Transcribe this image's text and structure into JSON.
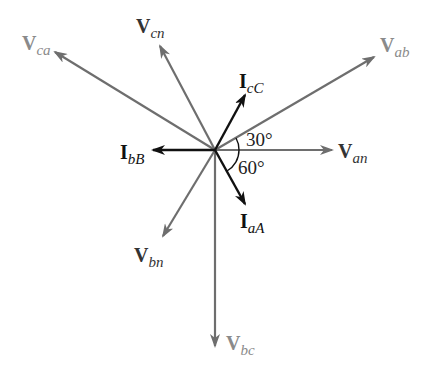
{
  "diagram": {
    "type": "phasor-diagram",
    "origin": [
      215,
      150
    ],
    "colors": {
      "voltage": "#6e6e6e",
      "voltage_label_line": "#9a9a9a",
      "current": "#111111",
      "angle_arc": "#111111"
    },
    "phasors": [
      {
        "id": "Van",
        "main": "V",
        "sub": "an",
        "kind": "voltage",
        "tip": [
          332,
          150
        ],
        "label_pos": [
          338,
          158
        ]
      },
      {
        "id": "Vab",
        "main": "V",
        "sub": "ab",
        "kind": "line-voltage",
        "tip": [
          374,
          57
        ],
        "label_pos": [
          380,
          52
        ]
      },
      {
        "id": "Vca",
        "main": "V",
        "sub": "ca",
        "kind": "line-voltage",
        "tip": [
          55,
          52
        ],
        "label_pos": [
          22,
          50
        ]
      },
      {
        "id": "Vcn",
        "main": "V",
        "sub": "cn",
        "kind": "voltage",
        "tip": [
          160,
          46
        ],
        "label_pos": [
          136,
          33
        ]
      },
      {
        "id": "Vbn",
        "main": "V",
        "sub": "bn",
        "kind": "voltage",
        "tip": [
          163,
          236
        ],
        "label_pos": [
          134,
          262
        ]
      },
      {
        "id": "Vbc",
        "main": "V",
        "sub": "bc",
        "kind": "line-voltage",
        "tip": [
          215,
          346
        ],
        "label_pos": [
          226,
          350
        ]
      },
      {
        "id": "IcC",
        "main": "I",
        "sub": "cC",
        "kind": "current",
        "tip": [
          245,
          95
        ],
        "label_pos": [
          239,
          88
        ]
      },
      {
        "id": "IbB",
        "main": "I",
        "sub": "bB",
        "kind": "current",
        "tip": [
          153,
          150
        ],
        "label_pos": [
          120,
          159
        ]
      },
      {
        "id": "IaA",
        "main": "I",
        "sub": "aA",
        "kind": "current",
        "tip": [
          245,
          204
        ],
        "label_pos": [
          240,
          228
        ]
      }
    ],
    "angles": [
      {
        "label": "30°",
        "pos": [
          246,
          146
        ]
      },
      {
        "label": "60°",
        "pos": [
          238,
          174
        ]
      }
    ]
  }
}
